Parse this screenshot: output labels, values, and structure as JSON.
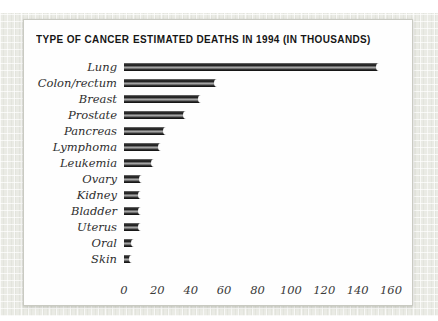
{
  "header": {
    "left_title": "TYPE OF CANCER",
    "right_title": "ESTIMATED DEATHS IN 1994 (IN THOUSANDS)"
  },
  "chart_data": {
    "type": "bar",
    "orientation": "horizontal",
    "title": "ESTIMATED DEATHS IN 1994 (IN THOUSANDS)",
    "xlabel": "",
    "ylabel": "TYPE OF CANCER",
    "categories": [
      "Lung",
      "Colon/rectum",
      "Breast",
      "Prostate",
      "Pancreas",
      "Lymphoma",
      "Leukemia",
      "Ovary",
      "Kidney",
      "Bladder",
      "Uterus",
      "Oral",
      "Skin"
    ],
    "values": [
      153,
      56,
      46,
      37,
      25,
      22,
      18,
      11,
      10,
      10,
      10,
      6,
      5
    ],
    "x_ticks": [
      0,
      20,
      40,
      60,
      80,
      100,
      120,
      140,
      160
    ],
    "xlim": [
      0,
      160
    ],
    "grid": false,
    "legend": false,
    "colors": {
      "bar_dark": "#1d1d1d",
      "bar_highlight": "#ababab",
      "card_background": "#fefefe",
      "card_border": "#c9cac2",
      "paper_background": "#eaebe5",
      "label_text": "#2e2e2e",
      "header_text": "#161616"
    }
  }
}
